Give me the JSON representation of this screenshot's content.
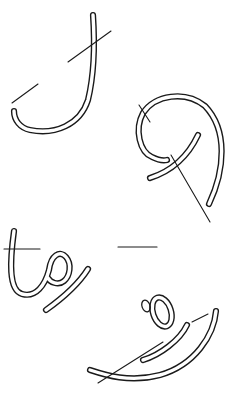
{
  "figure": {
    "width": 229,
    "height": 393,
    "background": "#ffffff",
    "ink": "#1a1a1a",
    "glyphs": [
      {
        "name": "glyph-1-hook",
        "strokes": [
          "M 93 15 C 95 45 94 75 88 100 C 80 125 55 135 30 130 C 20 128 14 120 14 111"
        ],
        "guides": [
          [
            12,
            103,
            38,
            84
          ],
          [
            68,
            62,
            111,
            31
          ]
        ]
      },
      {
        "name": "glyph-2-loop",
        "strokes": [
          "M 209 204 C 225 170 228 130 205 106 C 185 90 155 95 143 113 C 134 130 140 152 152 157 C 158 160 163 161 167 160",
          "M 198 135 C 190 152 175 170 150 178"
        ],
        "guides": [
          [
            139,
            105,
            150,
            122
          ],
          [
            171,
            155,
            210,
            222
          ]
        ]
      },
      {
        "name": "glyph-3-loop-tail",
        "strokes": [
          "M 14 231 C 10 260 8 290 22 294 C 36 298 45 285 49 270 C 51 255 60 250 66 257 C 72 264 70 276 64 281 C 58 286 50 282 48 278",
          "M 88 269 C 78 285 60 300 46 310"
        ],
        "guides": [
          [
            4,
            249,
            40,
            249
          ],
          [
            118,
            247,
            157,
            247
          ]
        ]
      },
      {
        "name": "glyph-4-loop-swash",
        "strokes": [
          "M 216 311 C 214 335 195 365 160 375 C 130 383 105 375 90 370",
          "M 187 325 C 180 340 160 355 143 360"
        ],
        "ovals": [
          {
            "cx": 162,
            "cy": 312,
            "rx": 9,
            "ry": 15,
            "rot": -18
          }
        ],
        "ovalCap": {
          "cx": 146,
          "cy": 306,
          "rx": 4,
          "ry": 6,
          "rot": -20
        },
        "guides": [
          [
            98,
            383,
            163,
            342
          ],
          [
            192,
            322,
            208,
            314
          ]
        ]
      }
    ]
  }
}
